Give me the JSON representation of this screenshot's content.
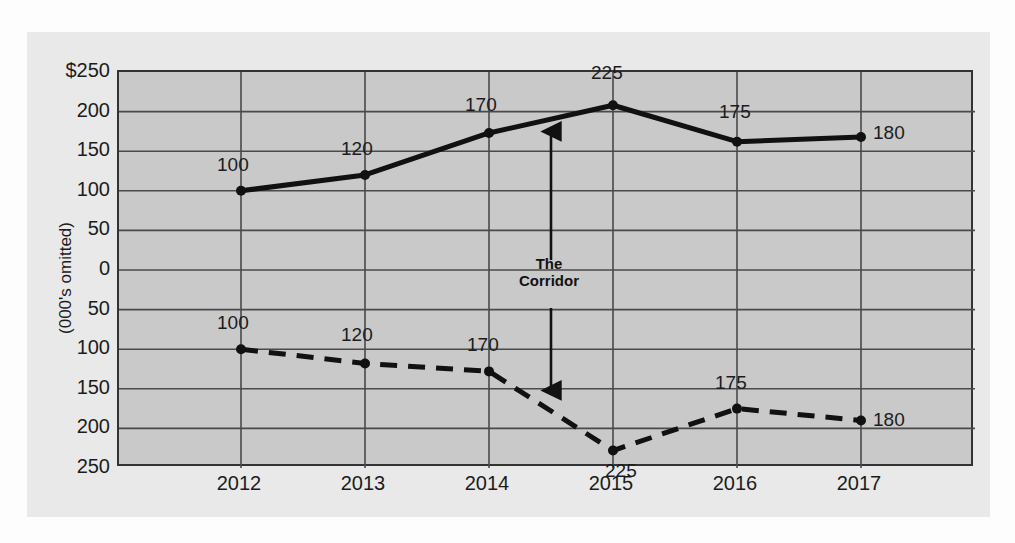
{
  "chart_data": {
    "type": "line",
    "title": "",
    "subtitle": "",
    "xlabel": "",
    "ylabel": "(000's omitted)",
    "categories": [
      "2012",
      "2013",
      "2014",
      "2015",
      "2016",
      "2017"
    ],
    "grid": true,
    "legend": "none",
    "y_axis": {
      "tick_labels": [
        "$250",
        "200",
        "150",
        "100",
        "50",
        "0",
        "50",
        "100",
        "150",
        "200",
        "250"
      ],
      "tick_values": [
        250,
        200,
        150,
        100,
        50,
        0,
        -50,
        -100,
        -150,
        -200,
        -250
      ],
      "ylim": [
        -250,
        250
      ],
      "note": "mirrored axis: upper half positive, lower half mirrored downward"
    },
    "series": [
      {
        "name": "upper-solid",
        "style": "solid",
        "labels": [
          "100",
          "120",
          "170",
          "225",
          "175",
          "180"
        ],
        "values": [
          100,
          120,
          173,
          208,
          162,
          168
        ]
      },
      {
        "name": "lower-dashed",
        "style": "dashed",
        "labels": [
          "100",
          "120",
          "170",
          "225",
          "175",
          "180"
        ],
        "values": [
          -100,
          -118,
          -128,
          -228,
          -175,
          -190
        ]
      }
    ],
    "annotations": [
      {
        "name": "the-corridor",
        "text_line1": "The",
        "text_line2": "Corridor",
        "arrow": "double-headed-vertical",
        "x_category_between": [
          "2014",
          "2015"
        ]
      }
    ],
    "colors": {
      "plot_background": "#c9c9c9",
      "mat_background": "#e9e9e9",
      "grid": "#4a4a4a",
      "line": "#111111",
      "text": "#1c1c1c",
      "page": "#fdfdfd"
    }
  }
}
